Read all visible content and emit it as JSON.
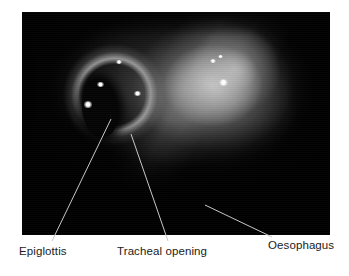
{
  "figure": {
    "kind": "annotated-endoscopic-photograph",
    "modality": "laryngoscopy",
    "image_alt": "Endoscopic view of the larynx showing the epiglottis, tracheal opening and oesophagus",
    "background_color": "#ffffff",
    "photo_background_color": "#000000",
    "leader_line_color": "#c8c8c8",
    "label_color": "#1b1b1b",
    "photo_bounds": {
      "x": 22,
      "y": 12,
      "width": 308,
      "height": 223
    }
  },
  "annotations": [
    {
      "id": "epiglottis",
      "label": "Epiglottis",
      "label_position": {
        "x": 19,
        "y": 245
      },
      "leader_line": {
        "x1": 111,
        "y1": 119,
        "x2": 52,
        "y2": 241
      }
    },
    {
      "id": "tracheal-opening",
      "label": "Tracheal opening",
      "label_position": {
        "x": 117,
        "y": 245
      },
      "leader_line": {
        "x1": 131,
        "y1": 134,
        "x2": 168,
        "y2": 241
      }
    },
    {
      "id": "oesophagus",
      "label": "Oesophagus",
      "label_position": {
        "x": 268,
        "y": 239
      },
      "leader_line": {
        "x1": 205,
        "y1": 205,
        "x2": 272,
        "y2": 237
      }
    }
  ],
  "photo_features": {
    "glottis": {
      "name": "tracheal-opening-aperture",
      "cx": 25.2,
      "cy": 43.0,
      "rx": 5.8,
      "ry": 13.0
    },
    "speculars": [
      {
        "name": "specular-highlight-1",
        "cx": 21.5,
        "cy": 41.5,
        "size": 8.2
      },
      {
        "name": "specular-highlight-2",
        "cx": 25.5,
        "cy": 32.5,
        "size": 6.4
      },
      {
        "name": "specular-highlight-3",
        "cx": 31.5,
        "cy": 22.5,
        "size": 5.6
      },
      {
        "name": "specular-highlight-4",
        "cx": 37.5,
        "cy": 36.5,
        "size": 6.8
      },
      {
        "name": "specular-highlight-5",
        "cx": 62.0,
        "cy": 22.0,
        "size": 6.0
      },
      {
        "name": "specular-highlight-6",
        "cx": 64.5,
        "cy": 20.0,
        "size": 4.4
      },
      {
        "name": "specular-highlight-7",
        "cx": 65.5,
        "cy": 31.5,
        "size": 8.6
      }
    ]
  }
}
